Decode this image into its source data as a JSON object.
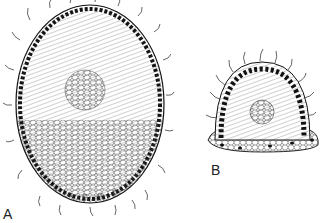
{
  "figure": {
    "panels": [
      {
        "id": "A",
        "label": "A",
        "description": "ovoid section with peripheral ciliated layer, radial central cell arrangement and basal cells"
      },
      {
        "id": "B",
        "label": "B",
        "description": "dome-shaped ciliated structure on basal epithelial cell layer"
      }
    ],
    "colors": {
      "ink": "#1a1a1a",
      "background": "#ffffff"
    }
  }
}
